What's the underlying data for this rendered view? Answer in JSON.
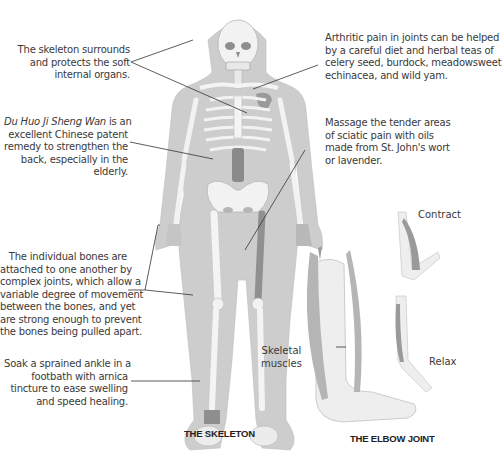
{
  "figure": {
    "left_caption": "THE SKELETON",
    "right_caption": "THE ELBOW JOINT"
  },
  "callouts": {
    "skeleton_protects": {
      "lines": [
        "The skeleton surrounds",
        "and protects the soft",
        "internal organs."
      ]
    },
    "du_huo": {
      "italic_prefix": "Du Huo Ji Sheng Wan",
      "first_line_rest": " is an",
      "lines": [
        "excellent Chinese patent",
        "remedy to strengthen the",
        "back, especially in the",
        "elderly."
      ]
    },
    "joints": {
      "lines": [
        "The individual bones are",
        "attached to one another by",
        "complex joints, which allow a",
        "variable degree of movement",
        "between the bones, and yet",
        "are strong enough to prevent",
        "the bones being pulled apart."
      ]
    },
    "ankle": {
      "lines": [
        "Soak a sprained ankle in a",
        "footbath with arnica",
        "tincture to ease swelling",
        "and speed healing."
      ]
    },
    "arthritic": {
      "lines": [
        "Arthritic pain in joints can be helped",
        "by a careful diet and herbal teas of",
        "celery seed, burdock, meadowsweet,",
        "echinacea, and wild yam."
      ]
    },
    "sciatic": {
      "lines": [
        "Massage the tender areas",
        "of sciatic pain with oils",
        "made from St. John's wort",
        "or lavender."
      ]
    }
  },
  "elbow_labels": {
    "contract": "Contract",
    "relax": "Relax",
    "skeletal_muscles_1": "Skeletal",
    "skeletal_muscles_2": "muscles"
  },
  "colors": {
    "body_silhouette": "#c9c9c9",
    "bone": "#f2f2f2",
    "bone_outline": "#b5b5b5",
    "highlight_dark": "#8e8e8e",
    "muscle": "#a9a9a9",
    "leader_line": "#333333",
    "text": "#3a3a3a"
  }
}
